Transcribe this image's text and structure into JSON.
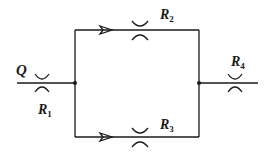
{
  "diagram": {
    "type": "flow-network",
    "stroke_color": "#1a1a1a",
    "labels": {
      "flow": "Q",
      "r1": {
        "main": "R",
        "sub": "1"
      },
      "r2": {
        "main": "R",
        "sub": "2"
      },
      "r3": {
        "main": "R",
        "sub": "3"
      },
      "r4": {
        "main": "R",
        "sub": "4"
      }
    },
    "nodes": [
      {
        "id": "left-junction"
      },
      {
        "id": "right-junction"
      }
    ],
    "elements": [
      {
        "id": "R1",
        "branch": "inlet"
      },
      {
        "id": "R2",
        "branch": "top"
      },
      {
        "id": "R3",
        "branch": "bottom"
      },
      {
        "id": "R4",
        "branch": "outlet"
      }
    ]
  }
}
